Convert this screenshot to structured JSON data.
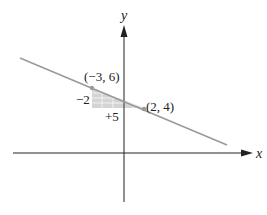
{
  "diagram": {
    "type": "coordinate-plane-line-slope",
    "axes": {
      "x_label": "x",
      "y_label": "y"
    },
    "line": {
      "color": "#9a9a9a",
      "description": "line through two points with negative slope"
    },
    "points": [
      {
        "label": "(−3, 6)",
        "x": -3,
        "y": 6
      },
      {
        "label": "(2, 4)",
        "x": 2,
        "y": 4
      }
    ],
    "slope_triangle": {
      "fill": "#d4d4d4",
      "rise_label": "−2",
      "run_label": "+5"
    },
    "colors": {
      "axis": "#222222",
      "line": "#9a9a9a",
      "point": "#9a9a9a",
      "triangle": "#d4d4d4",
      "grid": "#ffffff"
    }
  }
}
